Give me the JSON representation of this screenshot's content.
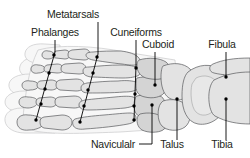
{
  "figure": {
    "background_color": "#ffffff",
    "label_color": "#231f20",
    "leader_color": "#000000",
    "bone_fill": "#e3e3e3",
    "bone_outline": "#58595b",
    "soft_tissue_fill": "#f7f7f7"
  },
  "labels": [
    {
      "id": "metatarsals",
      "text": "Metatarsals",
      "x": 73,
      "y": 18,
      "anchor": "middle"
    },
    {
      "id": "phalanges",
      "text": "Phalanges",
      "x": 55,
      "y": 36,
      "anchor": "middle"
    },
    {
      "id": "cuneiforms",
      "text": "Cuneiforms",
      "x": 136,
      "y": 36,
      "anchor": "middle"
    },
    {
      "id": "cuboid",
      "text": "Cuboid",
      "x": 158,
      "y": 48,
      "anchor": "middle"
    },
    {
      "id": "fibula",
      "text": "Fibula",
      "x": 222,
      "y": 48,
      "anchor": "middle"
    },
    {
      "id": "naviculalr",
      "text": "Naviculalr",
      "x": 113,
      "y": 148,
      "anchor": "middle"
    },
    {
      "id": "talus",
      "text": "Talus",
      "x": 172,
      "y": 148,
      "anchor": "middle"
    },
    {
      "id": "tibia",
      "text": "Tibia",
      "x": 222,
      "y": 148,
      "anchor": "middle"
    }
  ],
  "bone_groups": [
    {
      "id": "phalanges-group",
      "name": "Phalanges",
      "count": 14
    },
    {
      "id": "metatarsals-group",
      "name": "Metatarsals",
      "count": 5
    },
    {
      "id": "cuneiforms-group",
      "name": "Cuneiforms",
      "count": 3
    },
    {
      "id": "cuboid-bone",
      "name": "Cuboid",
      "count": 1
    },
    {
      "id": "navicular-bone",
      "name": "Navicular",
      "count": 1
    },
    {
      "id": "talus-bone",
      "name": "Talus",
      "count": 1
    },
    {
      "id": "tibia-bone",
      "name": "Tibia",
      "count": 1
    },
    {
      "id": "fibula-bone",
      "name": "Fibula",
      "count": 1
    }
  ]
}
